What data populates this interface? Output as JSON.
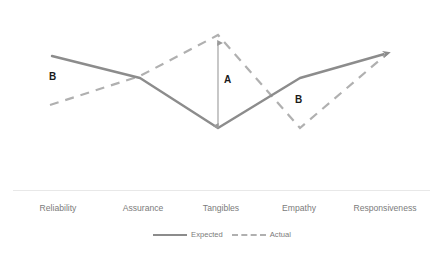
{
  "chart_data": {
    "type": "line",
    "title": "",
    "xlabel": "",
    "ylabel": "",
    "grid": false,
    "legend_position": "bottom-center",
    "categories": [
      "Reliability",
      "Assurance",
      "Tangibles",
      "Empathy",
      "Responsiveness"
    ],
    "series": [
      {
        "name": "Expected",
        "style": "solid",
        "color": "#8c8c8c",
        "values": [
          5.0,
          3.8,
          1.0,
          3.6,
          4.9
        ],
        "points": [
          [
            52,
            56
          ],
          [
            140,
            78
          ],
          [
            218,
            128
          ],
          [
            300,
            78
          ],
          [
            388,
            53
          ]
        ]
      },
      {
        "name": "Actual",
        "style": "dashed",
        "color": "#b0b0b0",
        "values": [
          1.9,
          3.6,
          5.4,
          1.0,
          4.9
        ],
        "points": [
          [
            50,
            105
          ],
          [
            140,
            76
          ],
          [
            218,
            35
          ],
          [
            300,
            128
          ],
          [
            388,
            53
          ]
        ]
      }
    ],
    "annotations": [
      {
        "label": "B",
        "x": 55,
        "y": 77,
        "note": "gap at Reliability"
      },
      {
        "label": "A",
        "x": 227,
        "y": 80,
        "note": "gap at Tangibles, arrow between Actual peak and Expected valley"
      },
      {
        "label": "B",
        "x": 298,
        "y": 99,
        "note": "gap at Empathy"
      }
    ],
    "arrow": {
      "x": 218,
      "y_top": 41,
      "y_bottom": 127,
      "color": "#9a9a9a"
    },
    "axis_line": {
      "x1": 13,
      "x2": 430,
      "y": 190,
      "color": "#e8e8e8"
    }
  },
  "legend": {
    "items": [
      {
        "label": "Expected",
        "swatch": "solid-line-swatch"
      },
      {
        "label": "Actual",
        "swatch": "dashed-line-swatch"
      }
    ]
  }
}
